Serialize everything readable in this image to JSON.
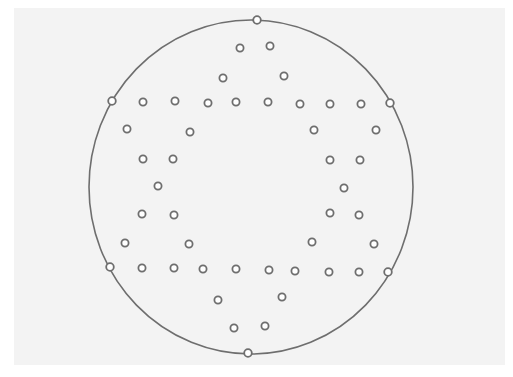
{
  "diagram": {
    "type": "node-layout",
    "background_color": "#f3f3f3",
    "stroke_color": "#6e6e6e",
    "node_fill": "#ffffff",
    "boundary": {
      "cx": 251,
      "cy": 187,
      "rx": 162,
      "ry": 167
    },
    "boundary_nodes": [
      {
        "x": 257,
        "y": 20
      },
      {
        "x": 112,
        "y": 101
      },
      {
        "x": 390,
        "y": 103
      },
      {
        "x": 110,
        "y": 267
      },
      {
        "x": 388,
        "y": 272
      },
      {
        "x": 248,
        "y": 353
      }
    ],
    "inner_nodes": [
      {
        "x": 240,
        "y": 48
      },
      {
        "x": 270,
        "y": 46
      },
      {
        "x": 223,
        "y": 78
      },
      {
        "x": 284,
        "y": 76
      },
      {
        "x": 143,
        "y": 102
      },
      {
        "x": 175,
        "y": 101
      },
      {
        "x": 208,
        "y": 103
      },
      {
        "x": 236,
        "y": 102
      },
      {
        "x": 268,
        "y": 102
      },
      {
        "x": 300,
        "y": 104
      },
      {
        "x": 330,
        "y": 104
      },
      {
        "x": 361,
        "y": 104
      },
      {
        "x": 127,
        "y": 129
      },
      {
        "x": 190,
        "y": 132
      },
      {
        "x": 314,
        "y": 130
      },
      {
        "x": 376,
        "y": 130
      },
      {
        "x": 143,
        "y": 159
      },
      {
        "x": 173,
        "y": 159
      },
      {
        "x": 330,
        "y": 160
      },
      {
        "x": 360,
        "y": 160
      },
      {
        "x": 158,
        "y": 186
      },
      {
        "x": 344,
        "y": 188
      },
      {
        "x": 142,
        "y": 214
      },
      {
        "x": 174,
        "y": 215
      },
      {
        "x": 330,
        "y": 213
      },
      {
        "x": 359,
        "y": 215
      },
      {
        "x": 125,
        "y": 243
      },
      {
        "x": 189,
        "y": 244
      },
      {
        "x": 312,
        "y": 242
      },
      {
        "x": 374,
        "y": 244
      },
      {
        "x": 142,
        "y": 268
      },
      {
        "x": 174,
        "y": 268
      },
      {
        "x": 203,
        "y": 269
      },
      {
        "x": 236,
        "y": 269
      },
      {
        "x": 269,
        "y": 270
      },
      {
        "x": 295,
        "y": 271
      },
      {
        "x": 329,
        "y": 272
      },
      {
        "x": 359,
        "y": 272
      },
      {
        "x": 218,
        "y": 300
      },
      {
        "x": 282,
        "y": 297
      },
      {
        "x": 234,
        "y": 328
      },
      {
        "x": 265,
        "y": 326
      }
    ]
  }
}
